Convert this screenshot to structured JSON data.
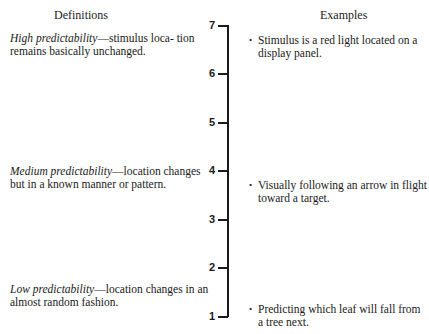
{
  "headers": {
    "definitions": "Definitions",
    "examples": "Examples"
  },
  "scale": {
    "ticks": [
      "7",
      "6",
      "5",
      "4",
      "3",
      "2",
      "1"
    ]
  },
  "definitions": [
    {
      "term": "High predictability",
      "dash": "—",
      "text_line1": "stimulus loca-",
      "text_rest": "tion remains basically unchanged."
    },
    {
      "term": "Medium predictability",
      "dash": "—",
      "text_line1": "location",
      "text_rest": "changes but in a known manner or pattern."
    },
    {
      "term": "Low predictability",
      "dash": "—",
      "text_line1": "location",
      "text_rest": "changes in an almost random fashion."
    }
  ],
  "examples": [
    {
      "bullet": "•",
      "text": "Stimulus is a red light located on a display panel."
    },
    {
      "bullet": "•",
      "text": "Visually following an arrow in flight toward a target."
    },
    {
      "bullet": "•",
      "text": "Predicting which leaf will fall from a tree next."
    }
  ]
}
